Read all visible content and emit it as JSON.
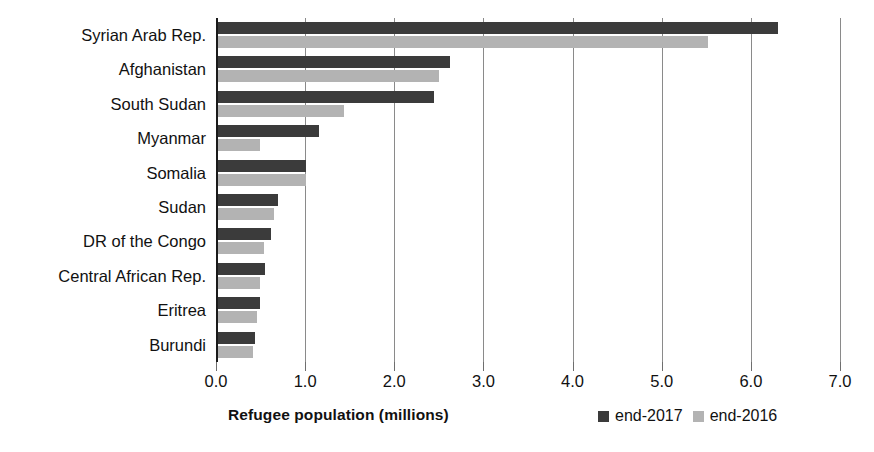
{
  "chart_data": {
    "type": "bar",
    "orientation": "horizontal",
    "title": "",
    "xlabel": "Refugee population (millions)",
    "ylabel": "",
    "xlim": [
      0.0,
      7.0
    ],
    "xticks": [
      "0.0",
      "1.0",
      "2.0",
      "3.0",
      "4.0",
      "5.0",
      "6.0",
      "7.0"
    ],
    "grid": "vertical",
    "legend_position": "bottom-right",
    "categories": [
      "Syrian Arab Rep.",
      "Afghanistan",
      "South Sudan",
      "Myanmar",
      "Somalia",
      "Sudan",
      "DR of the Congo",
      "Central African Rep.",
      "Eritrea",
      "Burundi"
    ],
    "series": [
      {
        "name": "end-2017",
        "color": "#3b3b3b",
        "values": [
          6.31,
          2.62,
          2.44,
          1.16,
          1.01,
          0.69,
          0.62,
          0.55,
          0.49,
          0.44
        ]
      },
      {
        "name": "end-2016",
        "color": "#b3b3b3",
        "values": [
          5.52,
          2.5,
          1.44,
          0.49,
          1.01,
          0.65,
          0.54,
          0.49,
          0.46,
          0.41
        ]
      }
    ]
  },
  "legend": {
    "items": [
      {
        "label": "end-2017",
        "color": "#3b3b3b"
      },
      {
        "label": "end-2016",
        "color": "#b3b3b3"
      }
    ]
  },
  "axis": {
    "x_title": "Refugee population (millions)"
  }
}
